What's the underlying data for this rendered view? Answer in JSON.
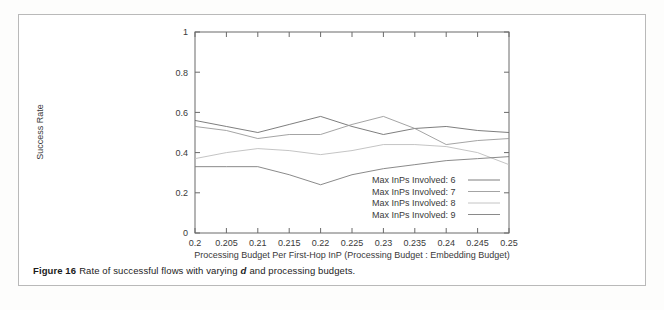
{
  "caption": {
    "figure_label": "Figure 16",
    "text_before_italic": "Rate of successful flows with varying",
    "italic_token": "d",
    "text_after_italic": "and processing budgets."
  },
  "chart_data": {
    "type": "line",
    "title": "",
    "xlabel": "Processing Budget Per First-Hop InP (Processing Budget : Embedding Budget)",
    "ylabel": "Success Rate",
    "xlim": [
      0.2,
      0.25
    ],
    "ylim": [
      0,
      1
    ],
    "grid": false,
    "legend_position": "inside-bottom-right",
    "x": [
      0.2,
      0.205,
      0.21,
      0.215,
      0.22,
      0.225,
      0.23,
      0.235,
      0.24,
      0.245,
      0.25
    ],
    "xtick_labels": [
      "0.2",
      "0.205",
      "0.21",
      "0.215",
      "0.22",
      "0.225",
      "0.23",
      "0.235",
      "0.24",
      "0.245",
      "0.25"
    ],
    "ytick_labels": [
      "0",
      "0.2",
      "0.4",
      "0.6",
      "0.8",
      "1"
    ],
    "ytick_values": [
      0,
      0.2,
      0.4,
      0.6,
      0.8,
      1
    ],
    "series": [
      {
        "name": "Max InPs Involved: 6",
        "color": "#6f6f6f",
        "values": [
          0.56,
          0.53,
          0.5,
          0.54,
          0.58,
          0.53,
          0.49,
          0.52,
          0.53,
          0.51,
          0.5
        ]
      },
      {
        "name": "Max InPs Involved: 7",
        "color": "#9a9a9a",
        "values": [
          0.53,
          0.51,
          0.47,
          0.49,
          0.49,
          0.54,
          0.58,
          0.52,
          0.44,
          0.46,
          0.47
        ]
      },
      {
        "name": "Max InPs Involved: 8",
        "color": "#bdbdbd",
        "values": [
          0.37,
          0.4,
          0.42,
          0.41,
          0.39,
          0.41,
          0.44,
          0.44,
          0.43,
          0.4,
          0.34
        ]
      },
      {
        "name": "Max InPs Involved: 9",
        "color": "#7d7d7d",
        "values": [
          0.33,
          0.33,
          0.33,
          0.29,
          0.24,
          0.29,
          0.32,
          0.34,
          0.36,
          0.37,
          0.38
        ]
      }
    ]
  }
}
